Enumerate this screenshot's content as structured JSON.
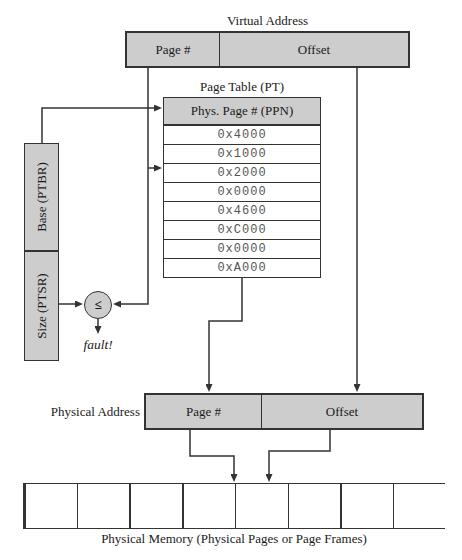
{
  "colors": {
    "box_fill": "#cdcdcd",
    "box_border": "#333333",
    "line_color": "#333333",
    "hex_text": "#555555",
    "row_fill": "#ffffff"
  },
  "virtual_address": {
    "title": "Virtual Address",
    "page_label": "Page #",
    "offset_label": "Offset"
  },
  "page_table": {
    "title": "Page Table (PT)",
    "header": "Phys. Page # (PPN)",
    "rows": [
      "0x4000",
      "0x1000",
      "0x2000",
      "0x0000",
      "0x4600",
      "0xC000",
      "0x0000",
      "0xA000"
    ]
  },
  "registers": {
    "base_label": "Base (PTBR)",
    "size_label": "Size (PTSR)"
  },
  "comparator": {
    "symbol": "≤",
    "fault_label": "fault!"
  },
  "physical_address": {
    "title": "Physical Address",
    "page_label": "Page #",
    "offset_label": "Offset"
  },
  "physical_memory": {
    "caption": "Physical Memory (Physical Pages or Page Frames)",
    "cell_count": 8
  }
}
